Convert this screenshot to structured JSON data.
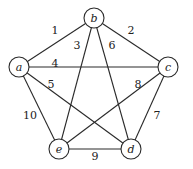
{
  "graph": {
    "nodes": [
      {
        "id": "a",
        "label": "a",
        "x": 19,
        "y": 67
      },
      {
        "id": "b",
        "label": "b",
        "x": 94,
        "y": 18
      },
      {
        "id": "c",
        "label": "c",
        "x": 168,
        "y": 67
      },
      {
        "id": "d",
        "label": "d",
        "x": 131,
        "y": 149
      },
      {
        "id": "e",
        "label": "e",
        "x": 59,
        "y": 149
      }
    ],
    "node_radius": 10,
    "edges": [
      {
        "from": "a",
        "to": "b",
        "weight": "1",
        "label_x": 55,
        "label_y": 34
      },
      {
        "from": "b",
        "to": "c",
        "weight": "2",
        "label_x": 131,
        "label_y": 34
      },
      {
        "from": "b",
        "to": "e",
        "weight": "3",
        "label_x": 77,
        "label_y": 49
      },
      {
        "from": "a",
        "to": "c",
        "weight": "4",
        "label_x": 55,
        "label_y": 67
      },
      {
        "from": "a",
        "to": "d",
        "weight": "5",
        "label_x": 51,
        "label_y": 88
      },
      {
        "from": "b",
        "to": "d",
        "weight": "6",
        "label_x": 112,
        "label_y": 49
      },
      {
        "from": "c",
        "to": "d",
        "weight": "7",
        "label_x": 157,
        "label_y": 119
      },
      {
        "from": "c",
        "to": "e",
        "weight": "8",
        "label_x": 138,
        "label_y": 88
      },
      {
        "from": "e",
        "to": "d",
        "weight": "9",
        "label_x": 95,
        "label_y": 160
      },
      {
        "from": "a",
        "to": "e",
        "weight": "10",
        "label_x": 30,
        "label_y": 119
      }
    ]
  }
}
